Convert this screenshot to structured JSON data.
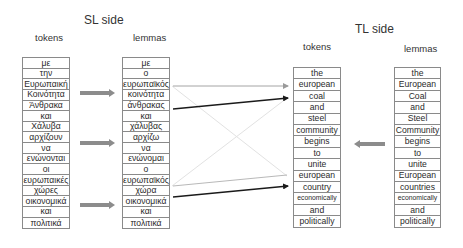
{
  "sl_side": {
    "title": "SL side",
    "tokens_header": "tokens",
    "lemmas_header": "lemmas",
    "tokens": [
      "με",
      "την",
      "Ευρωπαική",
      "Κοινότητα",
      "Άνθρακα",
      "και",
      "Χάλυβα",
      "αρχίζουν",
      "να",
      "ενώνονται",
      "οι",
      "ευρωπαικές",
      "χώρες",
      "οικονομικά",
      "και",
      "πολιτικά"
    ],
    "lemmas": [
      "με",
      "ο",
      "ευρωπαϊκός",
      "κοινότητα",
      "άνθρακας",
      "και",
      "χάλυβας",
      "αρχίζω",
      "να",
      "ενώνομαι",
      "ο",
      "ευρωπαϊκός",
      "χώρα",
      "οικονομικά",
      "και",
      "πολιτικά"
    ]
  },
  "tl_side": {
    "title": "TL side",
    "tokens_header": "tokens",
    "lemmas_header": "lemmas",
    "tokens": [
      "the",
      "european",
      "coal",
      "and",
      "steel",
      "community",
      "begins",
      "to",
      "unite",
      "european",
      "country",
      "economically",
      "and",
      "politically"
    ],
    "lemmas": [
      "the",
      "European",
      "Coal",
      "and",
      "Steel",
      "Community",
      "begins",
      "to",
      "unite",
      "European",
      "countries",
      "economically",
      "and",
      "politically"
    ]
  },
  "arrows": {
    "block_arrow_color": "#8c8c8c",
    "alignment_line_dark": "#1a1a1a",
    "alignment_line_light": "#9a9a9a",
    "faint_cross_color": "#e2e2e2"
  }
}
